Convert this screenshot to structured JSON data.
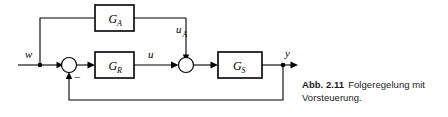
{
  "figure": {
    "caption_label": "Abb. 2.11",
    "caption_text": "Folgeregelung mit Vorsteuerung.",
    "stroke_color": "#000000",
    "background_color": "#ffffff"
  },
  "diagram": {
    "type": "control-block-diagram",
    "blocks": [
      {
        "id": "GA",
        "base": "G",
        "sub": "A"
      },
      {
        "id": "GR",
        "base": "G",
        "sub": "R"
      },
      {
        "id": "GS",
        "base": "G",
        "sub": "S"
      }
    ],
    "signals": [
      {
        "id": "w",
        "base": "w",
        "sub": ""
      },
      {
        "id": "uA",
        "base": "u",
        "sub": "A"
      },
      {
        "id": "u",
        "base": "u",
        "sub": ""
      },
      {
        "id": "y",
        "base": "y",
        "sub": ""
      }
    ],
    "summing_junctions": [
      {
        "id": "sum1",
        "sign": "−"
      },
      {
        "id": "sum2",
        "sign": ""
      }
    ]
  }
}
